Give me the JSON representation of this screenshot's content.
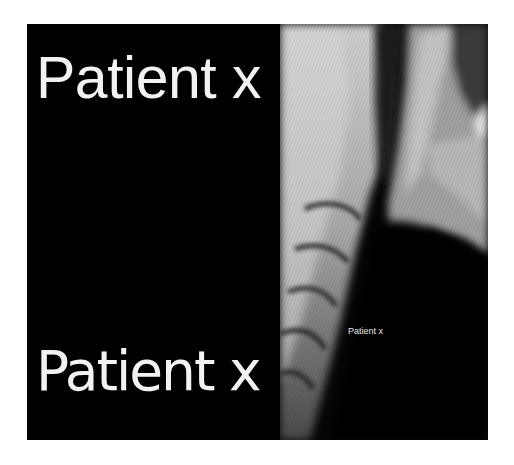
{
  "figure": {
    "left_panel": {
      "top_label": "Patient x",
      "bottom_label": "Patient x",
      "background": "#000000",
      "text_color": "#f2f2f2"
    },
    "right_panel": {
      "image_description": "lateral cervical spine X-ray",
      "overlay_label": "Patient x"
    }
  }
}
